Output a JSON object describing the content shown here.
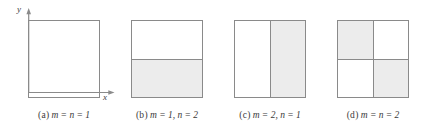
{
  "figure": {
    "background_color": "#ffffff",
    "border_color": "#8a8a8a",
    "shade_color": "#ececec",
    "axes": {
      "y_label": "y",
      "x_label": "x"
    },
    "panels": [
      {
        "key": "a",
        "tag": "(a)",
        "caption_math": "m = n = 1",
        "columns": 1,
        "rows": 1,
        "has_axes": true,
        "cells": [
          {
            "shaded": false
          }
        ]
      },
      {
        "key": "b",
        "tag": "(b)",
        "caption_math": "m = 1, n = 2",
        "columns": 1,
        "rows": 2,
        "has_axes": false,
        "cells": [
          {
            "shaded": false
          },
          {
            "shaded": true
          }
        ]
      },
      {
        "key": "c",
        "tag": "(c)",
        "caption_math": "m = 2, n = 1",
        "columns": 2,
        "rows": 1,
        "has_axes": false,
        "cells": [
          {
            "shaded": false
          },
          {
            "shaded": true
          }
        ]
      },
      {
        "key": "d",
        "tag": "(d)",
        "caption_math": "m = n = 2",
        "columns": 2,
        "rows": 2,
        "has_axes": false,
        "cells": [
          {
            "shaded": true
          },
          {
            "shaded": false
          },
          {
            "shaded": false
          },
          {
            "shaded": true
          }
        ]
      }
    ]
  }
}
